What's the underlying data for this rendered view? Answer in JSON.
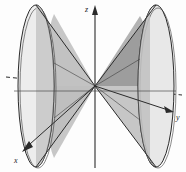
{
  "figure": {
    "background_color": "#fdfdfd"
  },
  "axes": {
    "z": {
      "label": "z",
      "label_x": 90,
      "label_y": 11,
      "direction": "up",
      "arrow": true,
      "line_color": "#2b2b2b"
    },
    "y": {
      "label": "y",
      "label_x": 176,
      "label_y": 117,
      "direction": "right-down",
      "arrow": true,
      "line_color": "#2b2b2b"
    },
    "x": {
      "label": "x",
      "label_x": 14,
      "label_y": 160,
      "direction": "lower-left",
      "arrow": true,
      "line_color": "#2b2b2b"
    },
    "hidden_segment_style": "dashed"
  },
  "origin": {
    "x": 95,
    "y": 86
  },
  "cones": [
    {
      "name": "left-nap",
      "side": "negative-y",
      "apex": {
        "x": 95,
        "y": 86
      },
      "base_ellipse": {
        "cx": 36,
        "cy": 86,
        "rx": 18,
        "ry": 81
      },
      "fill_light": "#ededed",
      "fill_mid": "#cfcfcf",
      "fill_dark": "#b4b4b4",
      "outline_color": "#2b2b2b"
    },
    {
      "name": "right-nap",
      "side": "positive-y",
      "apex": {
        "x": 95,
        "y": 86
      },
      "base_ellipse": {
        "cx": 156,
        "cy": 86,
        "rx": 18,
        "ry": 81
      },
      "fill_light": "#e4e4e4",
      "fill_mid": "#c2c2c2",
      "fill_dark": "#a3a3a3",
      "outline_color": "#2b2b2b"
    }
  ],
  "colors": {
    "stroke": "#2b2b2b",
    "stroke_light": "#555555",
    "lightest_gray": "#efefef",
    "light_gray": "#dcdcdc",
    "mid_gray": "#c2c2c2",
    "dark_gray": "#a3a3a3",
    "darkest_gray": "#8f8f8f"
  }
}
